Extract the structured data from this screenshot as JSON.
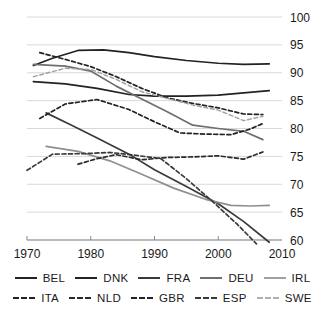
{
  "chart_data": {
    "type": "line",
    "title": "",
    "subtitle": "",
    "xlabel": "",
    "ylabel": "",
    "xlim": [
      1970,
      2010
    ],
    "ylim": [
      60,
      100
    ],
    "xticks": [
      1970,
      1980,
      1990,
      2000,
      2010
    ],
    "yticks": [
      60,
      65,
      70,
      75,
      80,
      85,
      90,
      95,
      100
    ],
    "grid": "horizontal",
    "legend_position": "bottom",
    "legend_columns": 5,
    "series": [
      {
        "name": "BEL",
        "style": "solid",
        "color": "#222222",
        "x": [
          1971,
          1974,
          1978,
          1982,
          1986,
          1990,
          1995,
          2000,
          2004,
          2008
        ],
        "values": [
          91.3,
          92.6,
          94.0,
          94.1,
          93.6,
          92.9,
          92.2,
          91.7,
          91.5,
          91.6
        ]
      },
      {
        "name": "DNK",
        "style": "solid",
        "color": "#222222",
        "x": [
          1971,
          1976,
          1981,
          1986,
          1990,
          1995,
          2000,
          2004,
          2008
        ],
        "values": [
          88.4,
          88.0,
          87.2,
          86.1,
          85.8,
          85.8,
          86.0,
          86.4,
          86.8
        ]
      },
      {
        "name": "FRA",
        "style": "solid",
        "color": "#3a3a3a",
        "x": [
          1973,
          1977,
          1981,
          1986,
          1990,
          1995,
          2000,
          2004,
          2008
        ],
        "values": [
          82.8,
          80.6,
          78.3,
          75.4,
          72.6,
          69.6,
          66.5,
          63.3,
          59.6
        ]
      },
      {
        "name": "DEU",
        "style": "solid",
        "color": "#6e6e6e",
        "x": [
          1971,
          1976,
          1980,
          1984,
          1988,
          1992,
          1996,
          2000,
          2004,
          2007
        ],
        "values": [
          91.5,
          91.2,
          90.3,
          87.6,
          85.3,
          83.0,
          80.6,
          80.0,
          79.5,
          78.0
        ]
      },
      {
        "name": "IRL",
        "style": "solid",
        "color": "#8f8f8f",
        "x": [
          1973,
          1978,
          1983,
          1988,
          1993,
          1998,
          2002,
          2005,
          2008
        ],
        "values": [
          76.8,
          75.9,
          74.2,
          71.8,
          69.3,
          67.3,
          66.2,
          66.1,
          66.2
        ]
      },
      {
        "name": "ITA",
        "style": "dashed",
        "color": "#222222",
        "x": [
          1972,
          1976,
          1980,
          1984,
          1988,
          1992,
          1996,
          2000,
          2004,
          2007
        ],
        "values": [
          93.6,
          92.4,
          91.1,
          89.3,
          87.2,
          85.5,
          84.5,
          83.7,
          82.6,
          82.5
        ]
      },
      {
        "name": "NLD",
        "style": "dashed",
        "color": "#2b2b2b",
        "x": [
          1978,
          1981,
          1984,
          1988,
          1992,
          1996,
          2000,
          2004,
          2007
        ],
        "values": [
          73.6,
          74.6,
          75.3,
          74.4,
          74.8,
          74.9,
          75.1,
          74.5,
          75.8
        ]
      },
      {
        "name": "GBR",
        "style": "dashed",
        "color": "#222222",
        "x": [
          1972,
          1976,
          1981,
          1986,
          1990,
          1994,
          1998,
          2002,
          2005,
          2007
        ],
        "values": [
          81.8,
          84.4,
          85.2,
          83.4,
          81.2,
          79.2,
          79.0,
          78.9,
          79.9,
          80.9
        ]
      },
      {
        "name": "ESP",
        "style": "dashed",
        "color": "#3a3a3a",
        "x": [
          1970,
          1974,
          1979,
          1983,
          1987,
          1991,
          1995,
          1999,
          2003,
          2006
        ],
        "values": [
          72.5,
          75.4,
          75.5,
          75.7,
          75.2,
          74.6,
          71.0,
          67.0,
          62.8,
          59.3
        ]
      },
      {
        "name": "SWE",
        "style": "dashed",
        "color": "#a0a0a0",
        "x": [
          1971,
          1976,
          1980,
          1984,
          1988,
          1992,
          1996,
          2000,
          2004,
          2007
        ],
        "values": [
          89.3,
          90.8,
          90.6,
          88.8,
          86.6,
          85.4,
          84.2,
          83.3,
          81.4,
          82.2
        ]
      }
    ]
  },
  "axis": {
    "y_tick_labels": [
      "100",
      "95",
      "90",
      "85",
      "80",
      "75",
      "70",
      "65",
      "60"
    ],
    "x_tick_labels": [
      "1970",
      "1980",
      "1990",
      "2000",
      "2010"
    ]
  },
  "legend": {
    "row1": [
      {
        "label": "BEL",
        "style": "solid",
        "color": "#222222"
      },
      {
        "label": "DNK",
        "style": "solid",
        "color": "#222222"
      },
      {
        "label": "FRA",
        "style": "solid",
        "color": "#3a3a3a"
      },
      {
        "label": "DEU",
        "style": "solid",
        "color": "#6e6e6e"
      },
      {
        "label": "IRL",
        "style": "solid",
        "color": "#a0a0a0"
      }
    ],
    "row2": [
      {
        "label": "ITA",
        "style": "dashed",
        "color": "#222222"
      },
      {
        "label": "NLD",
        "style": "dashed",
        "color": "#2b2b2b"
      },
      {
        "label": "GBR",
        "style": "dashed",
        "color": "#222222"
      },
      {
        "label": "ESP",
        "style": "dashed",
        "color": "#3a3a3a"
      },
      {
        "label": "SWE",
        "style": "dashed",
        "color": "#b0b0b0"
      }
    ]
  },
  "colors": {
    "grid": "#d8d8d8",
    "axis": "#888888",
    "text": "#1a1a1a",
    "background": "#ffffff"
  }
}
